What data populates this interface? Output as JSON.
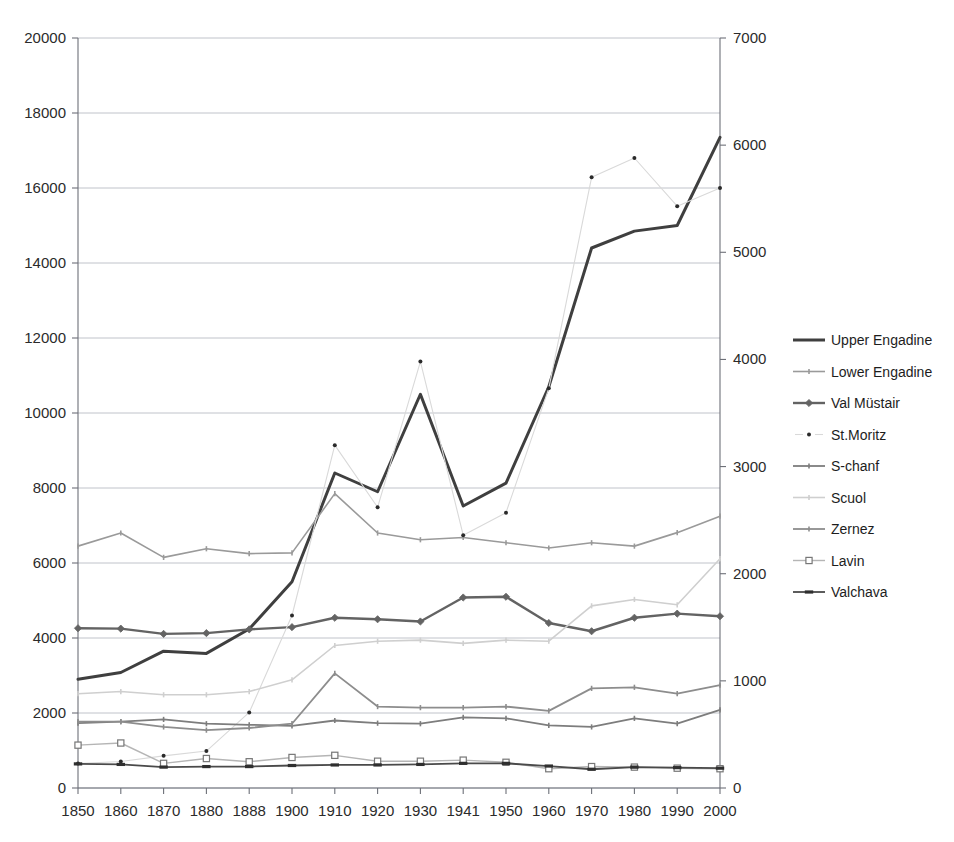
{
  "chart_data": {
    "type": "line",
    "title": "",
    "subtitle": "",
    "xlabel": "",
    "ylabel": "",
    "grid": true,
    "legend_position": "right",
    "categories": [
      "1850",
      "1860",
      "1870",
      "1880",
      "1888",
      "1900",
      "1910",
      "1920",
      "1930",
      "1941",
      "1950",
      "1960",
      "1970",
      "1980",
      "1990",
      "2000"
    ],
    "left_axis": {
      "label": "",
      "min": 0,
      "max": 20000,
      "step": 2000,
      "ticks": [
        "0",
        "2000",
        "4000",
        "6000",
        "8000",
        "10000",
        "12000",
        "14000",
        "16000",
        "18000",
        "20000"
      ]
    },
    "right_axis": {
      "label": "",
      "min": 0,
      "max": 7000,
      "step": 1000,
      "ticks": [
        "0",
        "1000",
        "2000",
        "3000",
        "4000",
        "5000",
        "6000",
        "7000"
      ]
    },
    "series": [
      {
        "name": "Upper Engadine",
        "axis": "left",
        "color": "#3f3f3f",
        "width": 3.0,
        "marker": "none",
        "values": [
          2900,
          3080,
          3650,
          3590,
          4240,
          5500,
          8400,
          7900,
          10500,
          7520,
          8130,
          10700,
          14400,
          14850,
          15000,
          17350
        ]
      },
      {
        "name": "Lower Engadine",
        "axis": "left",
        "color": "#9a9a9a",
        "width": 1.6,
        "marker": "tick",
        "values": [
          6450,
          6800,
          6150,
          6380,
          6250,
          6270,
          7850,
          6800,
          6620,
          6680,
          6540,
          6400,
          6540,
          6450,
          6810,
          7250
        ]
      },
      {
        "name": "Val Müstair",
        "axis": "left",
        "color": "#636363",
        "width": 2.4,
        "marker": "diamond",
        "values": [
          4260,
          4250,
          4110,
          4130,
          4230,
          4290,
          4540,
          4500,
          4440,
          5080,
          5100,
          4400,
          4180,
          4540,
          4650,
          4580
        ]
      },
      {
        "name": "St.Moritz",
        "axis": "right",
        "color": "#d9d9d9",
        "width": 1.1,
        "marker": "dot",
        "values": [
          228,
          248,
          300,
          345,
          705,
          1610,
          3200,
          2620,
          3980,
          2360,
          2570,
          3730,
          5700,
          5880,
          5430,
          5600
        ]
      },
      {
        "name": "S-chanf",
        "axis": "right",
        "color": "#7d7d7d",
        "width": 1.8,
        "marker": "tick",
        "values": [
          605,
          620,
          640,
          600,
          590,
          580,
          630,
          605,
          600,
          660,
          650,
          585,
          570,
          650,
          600,
          730
        ]
      },
      {
        "name": "Scuol",
        "axis": "right",
        "color": "#cfcfcf",
        "width": 1.6,
        "marker": "tick",
        "values": [
          880,
          900,
          870,
          870,
          900,
          1010,
          1330,
          1370,
          1380,
          1350,
          1380,
          1370,
          1700,
          1760,
          1710,
          2140
        ]
      },
      {
        "name": "Zernez",
        "axis": "right",
        "color": "#8d8d8d",
        "width": 1.8,
        "marker": "tick",
        "values": [
          620,
          620,
          570,
          540,
          560,
          600,
          1070,
          760,
          750,
          750,
          760,
          720,
          930,
          940,
          880,
          960
        ]
      },
      {
        "name": "Lavin",
        "axis": "right",
        "color": "#b5b5b5",
        "width": 1.4,
        "marker": "square",
        "values": [
          400,
          420,
          230,
          275,
          245,
          285,
          305,
          250,
          250,
          260,
          240,
          180,
          200,
          195,
          185,
          180
        ]
      },
      {
        "name": "Valchava",
        "axis": "right",
        "color": "#4a4a4a",
        "width": 1.8,
        "marker": "bar",
        "values": [
          225,
          220,
          195,
          200,
          200,
          210,
          215,
          215,
          220,
          230,
          230,
          205,
          175,
          195,
          190,
          185
        ]
      }
    ]
  },
  "legend": {
    "entries": [
      {
        "label": "Upper Engadine"
      },
      {
        "label": "Lower Engadine"
      },
      {
        "label": "Val Müstair"
      },
      {
        "label": "St.Moritz"
      },
      {
        "label": "S-chanf"
      },
      {
        "label": "Scuol"
      },
      {
        "label": "Zernez"
      },
      {
        "label": "Lavin"
      },
      {
        "label": "Valchava"
      }
    ]
  }
}
